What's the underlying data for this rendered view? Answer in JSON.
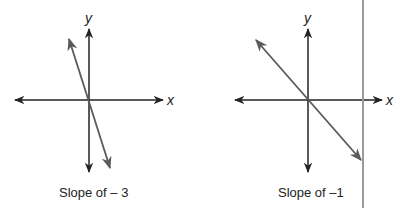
{
  "figure": {
    "panels": [
      {
        "id": "left",
        "caption": "Slope of – 3",
        "x_axis_label": "x",
        "y_axis_label": "y",
        "slope": -3
      },
      {
        "id": "right",
        "caption": "Slope of –1",
        "x_axis_label": "x",
        "y_axis_label": "y",
        "slope": -1
      }
    ],
    "colors": {
      "axis": "#222222",
      "line": "#5a5a5a",
      "divider": "#9a9a9a"
    }
  }
}
